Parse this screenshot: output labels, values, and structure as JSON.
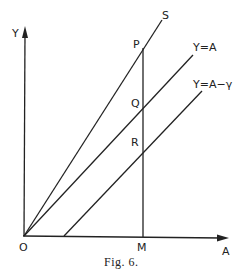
{
  "figure": {
    "caption": "Fig. 6.",
    "axes": {
      "y_label": "Y",
      "x_label": "A",
      "origin_label": "O"
    },
    "lines": [
      {
        "id": "S",
        "label": "S"
      },
      {
        "id": "Y=A",
        "label": "Y=A"
      },
      {
        "id": "Y=A-gamma",
        "label": "Y=A−γ"
      }
    ],
    "points": {
      "P": "P",
      "Q": "Q",
      "R": "R",
      "M": "M"
    },
    "colors": {
      "ink": "#222222",
      "background": "#ffffff"
    }
  }
}
